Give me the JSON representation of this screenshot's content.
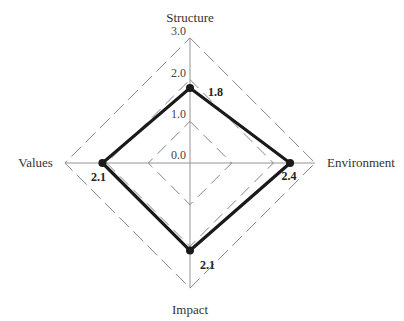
{
  "chart_data": {
    "type": "radar",
    "title": "",
    "axes": [
      "Structure",
      "Environment",
      "Impact",
      "Values"
    ],
    "series": [
      {
        "name": "Score",
        "values": [
          1.8,
          2.4,
          2.1,
          2.1
        ],
        "color": "#1a1a1a"
      }
    ],
    "radial_ticks": [
      "0.0",
      "1.0",
      "2.0",
      "3.0"
    ],
    "radial_range": [
      0,
      3.0
    ],
    "value_labels": [
      "1.8",
      "2.4",
      "2.1",
      "2.1"
    ],
    "grid": "dashed diamonds",
    "legend": "none"
  }
}
